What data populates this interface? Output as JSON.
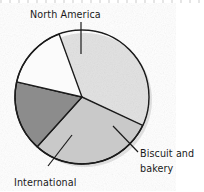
{
  "chart_data": {
    "type": "pie",
    "title": "",
    "subtitle": "",
    "xlabel": "",
    "ylabel": "",
    "legend_position": "none",
    "grid": false,
    "labels_outside": true,
    "categories": [
      "North America",
      "International",
      "Biscuit and bakery"
    ],
    "values": [
      68,
      17,
      15
    ],
    "value_unit": "percent",
    "slices": [
      {
        "name": "North America",
        "value": 68,
        "color": "#c9c9c9",
        "start_angle_deg": 115,
        "end_angle_deg": 222,
        "label": "North America",
        "label_position": "top",
        "leader_line": true
      },
      {
        "name": "International",
        "value": 17,
        "color": "#8c8c8c",
        "start_angle_deg": 222,
        "end_angle_deg": 283,
        "label": "International",
        "label_position": "bottom-left",
        "leader_line": true
      },
      {
        "name": "Biscuit and bakery",
        "value": 15,
        "color": "#fbfbfb",
        "start_angle_deg": 283,
        "end_angle_deg": 340,
        "label_line_1": "Biscuit and",
        "label_line_2": "bakery",
        "label_position": "bottom-right",
        "leader_line": true
      }
    ],
    "style": {
      "outline_color": "#1a1a1a",
      "outline_width": 1.4,
      "background": "#ffffff",
      "shadow": true,
      "shadow_color": "#d8d8d8"
    }
  },
  "labels": {
    "north_america": "North America",
    "international": "International",
    "biscuit_line1": "Biscuit and",
    "biscuit_line2": "bakery"
  }
}
